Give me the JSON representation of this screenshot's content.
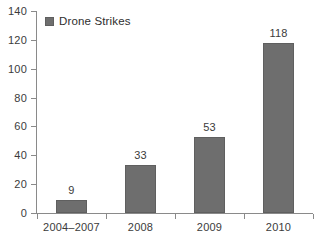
{
  "chart_data": {
    "type": "bar",
    "title": "",
    "xlabel": "",
    "ylabel": "",
    "categories": [
      "2004–2007",
      "2008",
      "2009",
      "2010"
    ],
    "values": [
      9,
      33,
      53,
      118
    ],
    "value_labels": [
      "9",
      "33",
      "53",
      "118"
    ],
    "series": [
      {
        "name": "Drone Strikes",
        "values": [
          9,
          33,
          53,
          118
        ],
        "color": "#6e6e6e"
      }
    ],
    "ylim": [
      0,
      140
    ],
    "ytick_step": 20,
    "ytick_labels": [
      "0",
      "20",
      "40",
      "60",
      "80",
      "100",
      "120",
      "140"
    ],
    "ytick_values": [
      0,
      20,
      40,
      60,
      80,
      100,
      120,
      140
    ],
    "grid": false,
    "legend": {
      "position": "top-left-inside",
      "entries": [
        {
          "label": "Drone Strikes",
          "color": "#6e6e6e",
          "swatch": "square-swatch-icon"
        }
      ]
    },
    "colors": {
      "bar_fill": "#6e6e6e",
      "bar_stroke": "#5f5f5f",
      "axis": "#8a8a8a",
      "text": "#3b3b3b",
      "background": "#ffffff"
    }
  }
}
